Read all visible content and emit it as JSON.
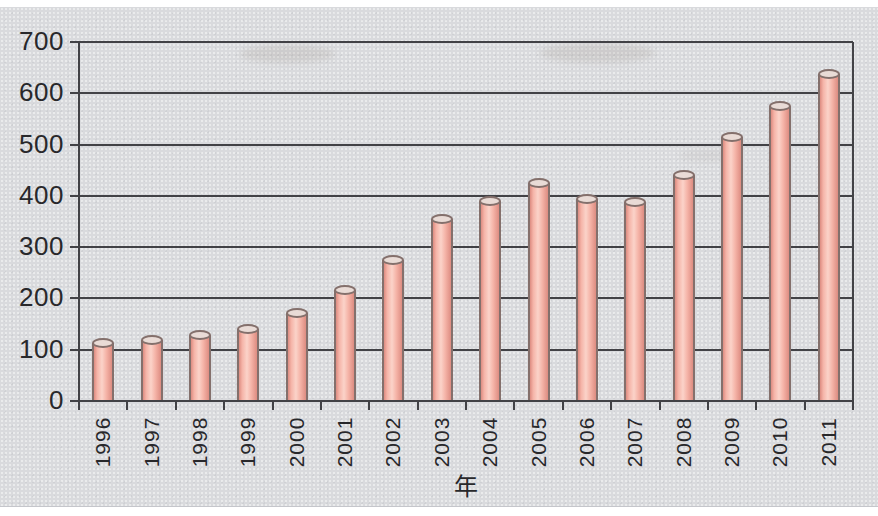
{
  "figure": {
    "page_color": "#ffffff",
    "scan_background_color": "#d9dadd"
  },
  "chart_data": {
    "type": "bar",
    "bar_style": "cylinder",
    "title": "",
    "xlabel": "年",
    "ylabel": "",
    "categories": [
      "1996",
      "1997",
      "1998",
      "1999",
      "2000",
      "2001",
      "2002",
      "2003",
      "2004",
      "2005",
      "2006",
      "2007",
      "2008",
      "2009",
      "2010",
      "2011"
    ],
    "values": [
      113,
      118,
      128,
      141,
      171,
      216,
      274,
      355,
      390,
      426,
      394,
      388,
      441,
      514,
      576,
      638
    ],
    "ylim": [
      0,
      700
    ],
    "yticks": [
      0,
      100,
      200,
      300,
      400,
      500,
      600,
      700
    ],
    "grid": true,
    "legend": "none",
    "x_tick_label_rotation": -90,
    "colors": {
      "bar_fill": "#f5b4a8",
      "bar_fill_light": "#fbd3c9",
      "bar_fill_dark": "#dd8c81",
      "bar_edge": "#84706c",
      "bar_cap_fill": "#e9dbd6",
      "grid_line": "#424246",
      "axis_line": "#424246",
      "tick_text": "#28282b"
    }
  }
}
